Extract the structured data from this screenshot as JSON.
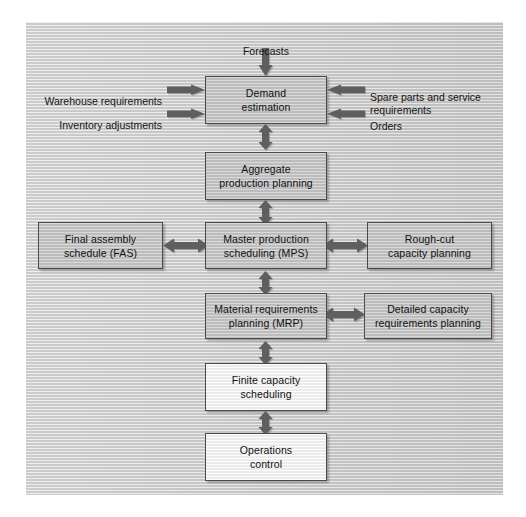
{
  "diagram": {
    "colors": {
      "page_background": "#ffffff",
      "canvas_background": "#d6d6d6",
      "box_fill_gray": "#c9c9c9",
      "box_fill_white": "#fbfbfb",
      "box_border": "#4a4a4a",
      "arrow_fill": "#5e5e5e",
      "text": "#111111"
    },
    "nodes": [
      {
        "id": "demand-estimation",
        "label": "Demand\nestimation",
        "fill": "gray"
      },
      {
        "id": "aggregate-production-planning",
        "label": "Aggregate\nproduction planning",
        "fill": "gray"
      },
      {
        "id": "final-assembly-schedule",
        "label": "Final assembly\nschedule (FAS)",
        "fill": "gray"
      },
      {
        "id": "master-production-scheduling",
        "label": "Master production\nscheduling (MPS)",
        "fill": "gray"
      },
      {
        "id": "rough-cut-capacity-planning",
        "label": "Rough-cut\ncapacity planning",
        "fill": "gray"
      },
      {
        "id": "material-requirements-planning",
        "label": "Material requirements\nplanning (MRP)",
        "fill": "gray"
      },
      {
        "id": "detailed-capacity-requirements-planning",
        "label": "Detailed capacity\nrequirements planning",
        "fill": "gray"
      },
      {
        "id": "finite-capacity-scheduling",
        "label": "Finite capacity\nscheduling",
        "fill": "white"
      },
      {
        "id": "operations-control",
        "label": "Operations\ncontrol",
        "fill": "white"
      }
    ],
    "input_labels": [
      {
        "id": "forecasts",
        "text": "Forecasts",
        "side": "top"
      },
      {
        "id": "warehouse-requirements",
        "text": "Warehouse requirements",
        "side": "left"
      },
      {
        "id": "inventory-adjustments",
        "text": "Inventory adjustments",
        "side": "left"
      },
      {
        "id": "spare-parts-and-service-requirements",
        "text": "Spare parts and service\nrequirements",
        "side": "right"
      },
      {
        "id": "orders",
        "text": "Orders",
        "side": "right"
      }
    ],
    "connections": [
      {
        "from": "forecasts",
        "to": "demand-estimation",
        "type": "single",
        "direction": "down"
      },
      {
        "from": "warehouse-requirements",
        "to": "demand-estimation",
        "type": "single",
        "direction": "right"
      },
      {
        "from": "inventory-adjustments",
        "to": "demand-estimation",
        "type": "single",
        "direction": "right"
      },
      {
        "from": "spare-parts-and-service-requirements",
        "to": "demand-estimation",
        "type": "single",
        "direction": "left"
      },
      {
        "from": "orders",
        "to": "demand-estimation",
        "type": "single",
        "direction": "left"
      },
      {
        "from": "demand-estimation",
        "to": "aggregate-production-planning",
        "type": "double",
        "direction": "vertical"
      },
      {
        "from": "aggregate-production-planning",
        "to": "master-production-scheduling",
        "type": "double",
        "direction": "vertical"
      },
      {
        "from": "final-assembly-schedule",
        "to": "master-production-scheduling",
        "type": "double",
        "direction": "horizontal"
      },
      {
        "from": "master-production-scheduling",
        "to": "rough-cut-capacity-planning",
        "type": "double",
        "direction": "horizontal"
      },
      {
        "from": "master-production-scheduling",
        "to": "material-requirements-planning",
        "type": "double",
        "direction": "vertical"
      },
      {
        "from": "material-requirements-planning",
        "to": "detailed-capacity-requirements-planning",
        "type": "double",
        "direction": "horizontal"
      },
      {
        "from": "material-requirements-planning",
        "to": "finite-capacity-scheduling",
        "type": "double",
        "direction": "vertical"
      },
      {
        "from": "finite-capacity-scheduling",
        "to": "operations-control",
        "type": "double",
        "direction": "vertical"
      }
    ]
  }
}
